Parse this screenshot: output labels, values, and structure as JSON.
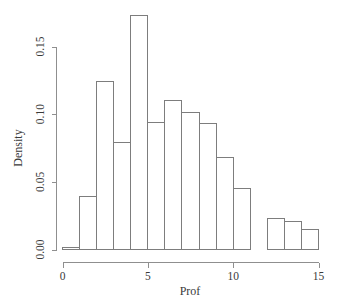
{
  "chart_data": {
    "type": "bar",
    "title": "",
    "subtitle": "",
    "xlabel": "Prof",
    "ylabel": "Density",
    "xlim": [
      0,
      15
    ],
    "ylim": [
      0,
      0.175
    ],
    "xticks": [
      0,
      5,
      10,
      15
    ],
    "xtick_labels": [
      "0",
      "5",
      "10",
      "15"
    ],
    "yticks": [
      0.0,
      0.05,
      0.1,
      0.15
    ],
    "ytick_labels": [
      "0.00",
      "0.05",
      "0.10",
      "0.15"
    ],
    "grid": false,
    "legend": null,
    "bin_width": 1,
    "bin_edges": [
      0,
      1,
      2,
      3,
      4,
      5,
      6,
      7,
      8,
      9,
      10,
      11,
      12,
      13,
      14,
      15
    ],
    "categories": [
      "0-1",
      "1-2",
      "2-3",
      "3-4",
      "4-5",
      "5-6",
      "6-7",
      "7-8",
      "8-9",
      "9-10",
      "10-11",
      "11-12",
      "12-13",
      "13-14",
      "14-15"
    ],
    "values": [
      0.0015,
      0.039,
      0.124,
      0.079,
      0.173,
      0.094,
      0.11,
      0.101,
      0.093,
      0.068,
      0.045,
      0.0,
      0.023,
      0.021,
      0.015
    ],
    "colors": {
      "bar_fill": "#ffffff",
      "bar_stroke": "#7d7d7d",
      "axis": "#8f8f8f",
      "text": "#3a3a3a",
      "background": "#ffffff"
    }
  },
  "axes": {
    "x_title": "Prof",
    "y_title": "Density"
  }
}
